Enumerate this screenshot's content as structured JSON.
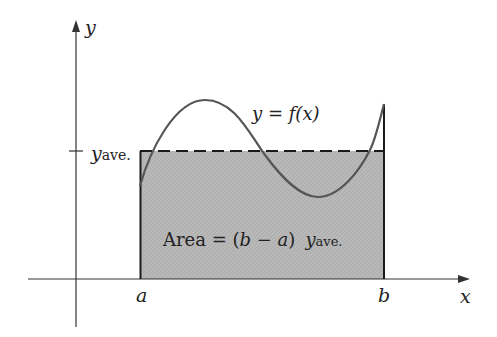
{
  "diagram": {
    "axes": {
      "x_label": "x",
      "y_label": "y"
    },
    "curve_label": "y = f(x)",
    "y_ave_label": {
      "main": "y",
      "sub": "ave."
    },
    "a_label": "a",
    "b_label": "b",
    "area_label": {
      "prefix": "Area = (",
      "b": "b",
      "minus": " − ",
      "a": "a",
      "suffix": ")",
      "y": "y",
      "sub": "ave."
    },
    "colors": {
      "shade": "#b5b5b5",
      "curve": "#555555",
      "axes": "#333333",
      "outline": "#1a1a1a",
      "text": "#222222"
    }
  }
}
